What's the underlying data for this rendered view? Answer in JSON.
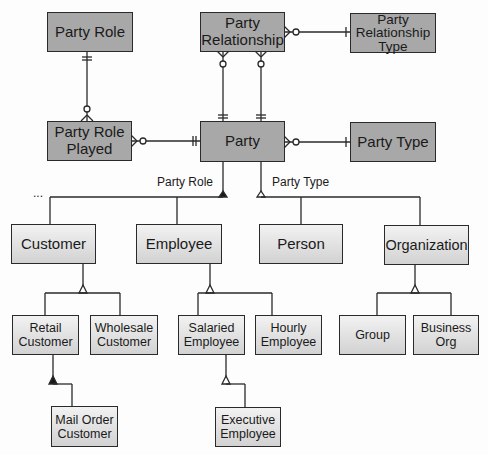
{
  "diagram": {
    "type": "entity-relationship / supertype-subtype",
    "entities": {
      "party_role": "Party Role",
      "party_relationship": "Party Relationship",
      "party_relationship_type": "Party Relationship Type",
      "party_role_played": "Party Role Played",
      "party": "Party",
      "party_type": "Party Type",
      "customer": "Customer",
      "employee": "Employee",
      "person": "Person",
      "organization": "Organization",
      "retail_customer": "Retail Customer",
      "wholesale_customer": "Wholesale Customer",
      "salaried_employee": "Salaried Employee",
      "hourly_employee": "Hourly Employee",
      "group": "Group",
      "business_org": "Business Org",
      "mail_order_customer": "Mail Order Customer",
      "executive_employee": "Executive Employee"
    },
    "subtype_labels": {
      "party_role": "Party Role",
      "party_type": "Party Type"
    },
    "ellipsis": "...",
    "colors": {
      "entity_fill": "#a8a8a8",
      "subtype_fill": "#e0e0e0",
      "line": "#2a2a2a"
    },
    "relationships": [
      {
        "from": "Party Role",
        "to": "Party Role Played",
        "cardinality": "one-to-zero-or-many"
      },
      {
        "from": "Party",
        "to": "Party Role Played",
        "cardinality": "one-to-zero-or-many"
      },
      {
        "from": "Party",
        "to": "Party Relationship",
        "cardinality": "one-to-zero-or-many (x2)"
      },
      {
        "from": "Party Relationship Type",
        "to": "Party Relationship",
        "cardinality": "one-to-zero-or-many"
      },
      {
        "from": "Party Type",
        "to": "Party",
        "cardinality": "one-to-zero-or-many"
      }
    ]
  }
}
